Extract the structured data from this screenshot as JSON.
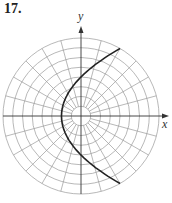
{
  "problem_number": "17.",
  "axes": {
    "x_label": "x",
    "y_label": "y"
  },
  "grid": {
    "type": "polar",
    "rings": 8,
    "spokes_deg": 15,
    "center": [
      81,
      116
    ],
    "ring_spacing_px": 9.75
  },
  "curve": {
    "equation": "r = 4/(1 - cos θ)",
    "type": "parabola",
    "opens": "right",
    "stroke": "#222222"
  },
  "colors": {
    "grid": "#9a9a9a",
    "axis": "#333333"
  }
}
